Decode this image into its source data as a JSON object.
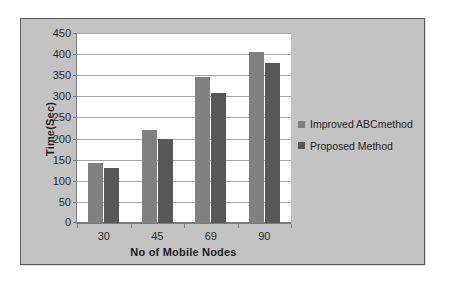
{
  "chart_data": {
    "type": "bar",
    "title": "",
    "xlabel": "No of Mobile Nodes",
    "ylabel": "Time(Sec)",
    "categories": [
      "30",
      "45",
      "69",
      "90"
    ],
    "series": [
      {
        "name": "Improved ABCmethod",
        "color": "#808080",
        "values": [
          142,
          220,
          347,
          405
        ]
      },
      {
        "name": "Proposed Method",
        "color": "#575757",
        "values": [
          130,
          200,
          308,
          380
        ]
      }
    ],
    "ylim": [
      0,
      450
    ],
    "ytick_values": [
      0,
      50,
      100,
      150,
      200,
      250,
      300,
      350,
      400,
      450
    ],
    "ytick_labels": [
      "0",
      "50",
      "100",
      "150",
      "200",
      "250",
      "300",
      "350",
      "400",
      "450"
    ],
    "grid": true,
    "legend_position": "right"
  },
  "figure": {
    "frame_background": "#c3c3c3",
    "plot_background": "#ffffff",
    "gridline_color": "#a8a8a8",
    "axis_color": "#7b7b7b"
  }
}
